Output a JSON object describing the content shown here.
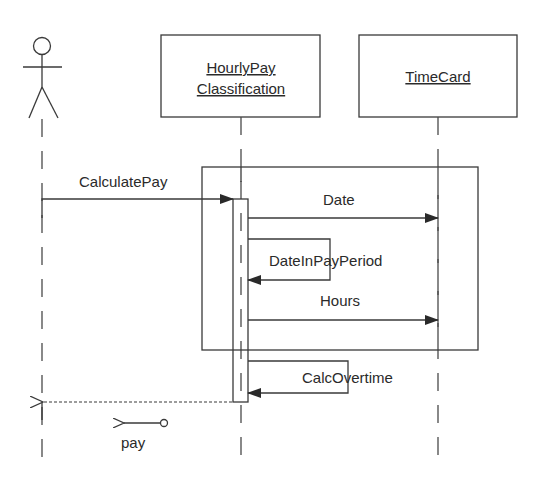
{
  "diagram": {
    "type": "UML sequence diagram",
    "actor": {
      "label": ""
    },
    "objects": [
      {
        "id": "hourly",
        "name_line1": "HourlyPay",
        "name_line2": "Classification"
      },
      {
        "id": "timecard",
        "name_line1": "TimeCard"
      }
    ],
    "messages": [
      {
        "id": "calculate_pay",
        "label": "CalculatePay",
        "from": "actor",
        "to": "hourly",
        "kind": "synchronous"
      },
      {
        "id": "date",
        "label": "Date",
        "from": "hourly",
        "to": "timecard",
        "kind": "synchronous"
      },
      {
        "id": "date_in_pay_period",
        "label": "DateInPayPeriod",
        "from": "hourly",
        "to": "hourly",
        "kind": "self-call"
      },
      {
        "id": "hours",
        "label": "Hours",
        "from": "hourly",
        "to": "timecard",
        "kind": "synchronous"
      },
      {
        "id": "calc_overtime",
        "label": "CalcOvertime",
        "from": "hourly",
        "to": "hourly",
        "kind": "self-call"
      },
      {
        "id": "return_pay",
        "label": "",
        "from": "hourly",
        "to": "actor",
        "kind": "return"
      }
    ],
    "return_value": {
      "label": "pay",
      "icon": "data-token-arrow-icon"
    },
    "fragment": {
      "label": "",
      "kind": "loop-box"
    },
    "colors": {
      "ink": "#3a3a3a",
      "text": "#2a2a2a",
      "background": "#ffffff"
    }
  }
}
